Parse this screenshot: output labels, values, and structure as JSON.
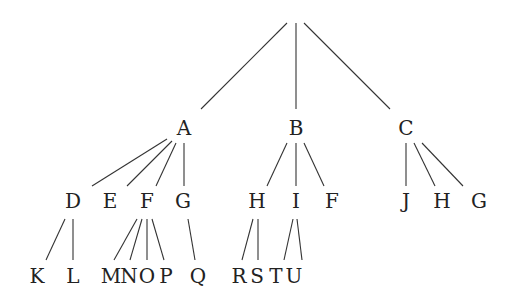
{
  "diagram": {
    "type": "tree",
    "root": {
      "id": "root",
      "label": "",
      "x": 296,
      "y": 14
    },
    "nodes": [
      {
        "id": "A",
        "label": "A",
        "x": 184,
        "y": 128
      },
      {
        "id": "B",
        "label": "B",
        "x": 296,
        "y": 128
      },
      {
        "id": "C",
        "label": "C",
        "x": 406,
        "y": 128
      },
      {
        "id": "D",
        "label": "D",
        "x": 73,
        "y": 201
      },
      {
        "id": "E",
        "label": "E",
        "x": 110,
        "y": 201
      },
      {
        "id": "F1",
        "label": "F",
        "x": 147,
        "y": 201
      },
      {
        "id": "G1",
        "label": "G",
        "x": 183,
        "y": 201
      },
      {
        "id": "H1",
        "label": "H",
        "x": 257,
        "y": 201
      },
      {
        "id": "I",
        "label": "I",
        "x": 296,
        "y": 201
      },
      {
        "id": "F2",
        "label": "F",
        "x": 332,
        "y": 201
      },
      {
        "id": "J",
        "label": "J",
        "x": 406,
        "y": 201
      },
      {
        "id": "H2",
        "label": "H",
        "x": 442,
        "y": 201
      },
      {
        "id": "G2",
        "label": "G",
        "x": 479,
        "y": 201
      },
      {
        "id": "K",
        "label": "K",
        "x": 37,
        "y": 276
      },
      {
        "id": "L",
        "label": "L",
        "x": 73,
        "y": 276
      },
      {
        "id": "M",
        "label": "M",
        "x": 111,
        "y": 276
      },
      {
        "id": "N",
        "label": "N",
        "x": 129,
        "y": 276
      },
      {
        "id": "O",
        "label": "O",
        "x": 147,
        "y": 276
      },
      {
        "id": "P",
        "label": "P",
        "x": 166,
        "y": 276
      },
      {
        "id": "Q",
        "label": "Q",
        "x": 198,
        "y": 276
      },
      {
        "id": "R",
        "label": "R",
        "x": 239,
        "y": 276
      },
      {
        "id": "S",
        "label": "S",
        "x": 257,
        "y": 276
      },
      {
        "id": "T",
        "label": "T",
        "x": 276,
        "y": 276
      },
      {
        "id": "U",
        "label": "U",
        "x": 294,
        "y": 276
      }
    ],
    "edges": [
      {
        "from": "root",
        "to": "A",
        "x1": 287,
        "y1": 23,
        "x2": 201,
        "y2": 109
      },
      {
        "from": "root",
        "to": "B",
        "x1": 296,
        "y1": 23,
        "x2": 296,
        "y2": 109
      },
      {
        "from": "root",
        "to": "C",
        "x1": 304,
        "y1": 23,
        "x2": 390,
        "y2": 109
      },
      {
        "from": "A",
        "to": "D",
        "x1": 167,
        "y1": 139,
        "x2": 92,
        "y2": 186
      },
      {
        "from": "A",
        "to": "E",
        "x1": 172,
        "y1": 141,
        "x2": 127,
        "y2": 186
      },
      {
        "from": "A",
        "to": "F1",
        "x1": 176,
        "y1": 143,
        "x2": 156,
        "y2": 186
      },
      {
        "from": "A",
        "to": "G1",
        "x1": 184,
        "y1": 143,
        "x2": 184,
        "y2": 186
      },
      {
        "from": "B",
        "to": "H1",
        "x1": 287,
        "y1": 143,
        "x2": 267,
        "y2": 186
      },
      {
        "from": "B",
        "to": "I",
        "x1": 296,
        "y1": 143,
        "x2": 296,
        "y2": 186
      },
      {
        "from": "B",
        "to": "F2",
        "x1": 304,
        "y1": 143,
        "x2": 324,
        "y2": 186
      },
      {
        "from": "C",
        "to": "J",
        "x1": 406,
        "y1": 143,
        "x2": 406,
        "y2": 186
      },
      {
        "from": "C",
        "to": "H2",
        "x1": 414,
        "y1": 143,
        "x2": 435,
        "y2": 186
      },
      {
        "from": "C",
        "to": "G2",
        "x1": 422,
        "y1": 143,
        "x2": 463,
        "y2": 186
      },
      {
        "from": "D",
        "to": "K",
        "x1": 65,
        "y1": 219,
        "x2": 46,
        "y2": 260
      },
      {
        "from": "D",
        "to": "L",
        "x1": 73,
        "y1": 219,
        "x2": 73,
        "y2": 260
      },
      {
        "from": "F1",
        "to": "M",
        "x1": 137,
        "y1": 219,
        "x2": 114,
        "y2": 260
      },
      {
        "from": "F1",
        "to": "N",
        "x1": 142,
        "y1": 219,
        "x2": 130,
        "y2": 260
      },
      {
        "from": "F1",
        "to": "O",
        "x1": 147,
        "y1": 219,
        "x2": 147,
        "y2": 260
      },
      {
        "from": "F1",
        "to": "P",
        "x1": 152,
        "y1": 219,
        "x2": 164,
        "y2": 260
      },
      {
        "from": "G1",
        "to": "Q",
        "x1": 188,
        "y1": 219,
        "x2": 195,
        "y2": 260
      },
      {
        "from": "H1",
        "to": "R",
        "x1": 253,
        "y1": 219,
        "x2": 242,
        "y2": 260
      },
      {
        "from": "H1",
        "to": "S",
        "x1": 258,
        "y1": 219,
        "x2": 258,
        "y2": 260
      },
      {
        "from": "I",
        "to": "T",
        "x1": 293,
        "y1": 219,
        "x2": 284,
        "y2": 260
      },
      {
        "from": "I",
        "to": "U",
        "x1": 297,
        "y1": 219,
        "x2": 302,
        "y2": 260
      }
    ]
  }
}
